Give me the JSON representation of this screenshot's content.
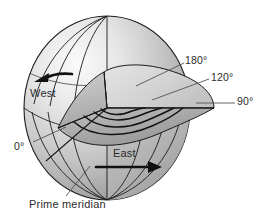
{
  "figure": {
    "background_color": "#ffffff"
  },
  "labels": {
    "deg180": "180°",
    "deg120": "120°",
    "deg90": "90°",
    "deg0": "0°",
    "west": "West",
    "east": "East",
    "prime_meridian": "Prime meridian"
  },
  "colors": {
    "outline": "#1a1a1a",
    "text": "#2b2b2b",
    "leader_line": "#555555",
    "sphere_light": "#f2f2f2",
    "sphere_mid": "#c9c9c9",
    "sphere_dark": "#9a9a9a",
    "wedge_top": "#d8d8d8",
    "wedge_face": "#b8b8b8",
    "wedge_shadow": "#8f8f8f",
    "arrow": "#111111"
  },
  "icons": {
    "west_arrow": "arrow-left-icon",
    "east_arrow": "arrow-right-icon"
  }
}
